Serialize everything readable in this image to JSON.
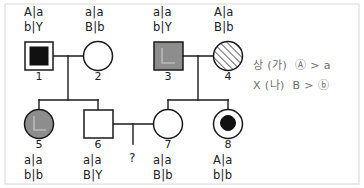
{
  "diagram": {
    "type": "pedigree-chart",
    "title": "",
    "stroke_color": "#1a1a1a",
    "fill_gray": "#8d8d8d",
    "fill_black": "#111111",
    "individuals": [
      {
        "id": "1",
        "label": "1",
        "sex": "male",
        "shape": "square",
        "fill": "inner-filled-square",
        "genotype_line1": "A|a",
        "genotype_line2": "b|Y",
        "genotype_position": "above",
        "cx": 39,
        "cy": 56
      },
      {
        "id": "2",
        "label": "2",
        "sex": "female",
        "shape": "circle",
        "fill": "unaffected",
        "genotype_line1": "a|a",
        "genotype_line2": "B|b",
        "genotype_position": "above",
        "cx": 98,
        "cy": 56
      },
      {
        "id": "3",
        "label": "3",
        "sex": "male",
        "shape": "square",
        "fill": "gray-shaded",
        "genotype_line1": "a|a",
        "genotype_line2": "b|Y",
        "genotype_position": "above",
        "cx": 168,
        "cy": 56
      },
      {
        "id": "4",
        "label": "4",
        "sex": "female",
        "shape": "circle",
        "fill": "diagonal-hatched",
        "genotype_line1": "A|a",
        "genotype_line2": "B|b",
        "genotype_position": "above",
        "cx": 228,
        "cy": 56
      },
      {
        "id": "5",
        "label": "5",
        "sex": "female",
        "shape": "circle",
        "fill": "gray-shaded",
        "genotype_line1": "a|a",
        "genotype_line2": "b|b",
        "genotype_position": "below",
        "cx": 39,
        "cy": 124
      },
      {
        "id": "6",
        "label": "6",
        "sex": "male",
        "shape": "square",
        "fill": "unaffected",
        "genotype_line1": "a|a",
        "genotype_line2": "B|Y",
        "genotype_position": "below",
        "cx": 98,
        "cy": 124
      },
      {
        "id": "7",
        "label": "7",
        "sex": "female",
        "shape": "circle",
        "fill": "unaffected",
        "genotype_line1": "a|a",
        "genotype_line2": "B|b",
        "genotype_position": "below",
        "cx": 168,
        "cy": 124
      },
      {
        "id": "8",
        "label": "8",
        "sex": "female",
        "shape": "circle",
        "fill": "inner-filled-circle",
        "genotype_line1": "A|a",
        "genotype_line2": "b|b",
        "genotype_position": "below",
        "cx": 228,
        "cy": 124
      }
    ],
    "unknown_offspring": {
      "label": "?",
      "x": 133,
      "y": 148
    },
    "matings": [
      {
        "name": "mating-1-2",
        "parents": [
          "1",
          "2"
        ],
        "children": [
          "5",
          "6"
        ]
      },
      {
        "name": "mating-3-4",
        "parents": [
          "3",
          "4"
        ],
        "children": [
          "7",
          "8"
        ]
      },
      {
        "name": "mating-6-7",
        "parents": [
          "6",
          "7"
        ],
        "children": [
          "?"
        ]
      }
    ]
  },
  "legend": {
    "line1": "상 (가)  Ⓐ > a",
    "line2": "X (나)  B > ⓑ"
  }
}
